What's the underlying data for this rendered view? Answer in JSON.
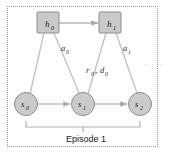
{
  "figure": {
    "frame_style": "dotted",
    "colors": {
      "node_fill": "#c9c9c9",
      "node_stroke": "#8a8a8a",
      "edge": "#b9b9b9",
      "arrow": "#a8a8a8",
      "text": "#1a1a1a",
      "frame": "#9a9a9a",
      "background": "#ffffff"
    }
  },
  "nodes": {
    "hidden": [
      {
        "id": "h0",
        "label": "h",
        "sub": "0",
        "shape": "square",
        "x": 48,
        "y": 23
      },
      {
        "id": "h1",
        "label": "h",
        "sub": "1",
        "shape": "square",
        "x": 110,
        "y": 23
      }
    ],
    "states": [
      {
        "id": "s0",
        "label": "s",
        "sub": "0",
        "shape": "circle",
        "x": 26,
        "y": 104
      },
      {
        "id": "s1",
        "label": "s",
        "sub": "1",
        "shape": "circle",
        "x": 83,
        "y": 104
      },
      {
        "id": "s2",
        "label": "s",
        "sub": "2",
        "shape": "circle",
        "x": 140,
        "y": 104
      }
    ]
  },
  "edges": [
    {
      "from": "h0",
      "to": "h1",
      "kind": "arrow",
      "label": ""
    },
    {
      "from": "s0",
      "to": "s1",
      "kind": "arrow",
      "label": ""
    },
    {
      "from": "s1",
      "to": "s2",
      "kind": "arrow",
      "label": ""
    },
    {
      "from": "s0",
      "to": "h0",
      "kind": "line",
      "label": ""
    },
    {
      "from": "h0",
      "to": "s1",
      "kind": "line",
      "label": "a0"
    },
    {
      "from": "s1",
      "to": "h1",
      "kind": "line",
      "label": "r0d0"
    },
    {
      "from": "h1",
      "to": "s2",
      "kind": "line",
      "label": "a1"
    }
  ],
  "labels": {
    "a0": {
      "base": "a",
      "sub": "0"
    },
    "a1": {
      "base": "a",
      "sub": "1"
    },
    "rd0": {
      "r": "r",
      "r_sub": "0",
      "comma": ",",
      "d": "d",
      "d_sub": "0"
    }
  },
  "annotations": {
    "ellipsis": "· · ·",
    "episode_bracket_caption": "Episode 1"
  }
}
